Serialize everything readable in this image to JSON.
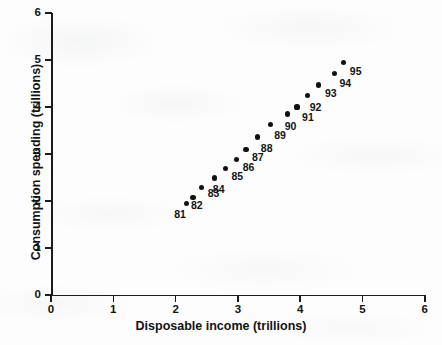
{
  "chart_data": {
    "type": "scatter",
    "title": "",
    "xlabel": "Disposable income (trillions)",
    "ylabel": "Consumption spending (trillions)",
    "xlim": [
      0,
      6
    ],
    "ylim": [
      0,
      6
    ],
    "xticks": [
      "0",
      "1",
      "2",
      "3",
      "4",
      "5",
      "6"
    ],
    "yticks": [
      "0",
      "1",
      "2",
      "3",
      "4",
      "5",
      "6"
    ],
    "grid": false,
    "legend": null,
    "marker_color": "#111111",
    "axis_color": "#1c1c1c",
    "background_color": "#fdfdfd",
    "point_label_position": "below-right",
    "points": [
      {
        "label": "81",
        "x": 2.17,
        "y": 1.95
      },
      {
        "label": "82",
        "x": 2.28,
        "y": 2.08
      },
      {
        "label": "83",
        "x": 2.42,
        "y": 2.28
      },
      {
        "label": "84",
        "x": 2.63,
        "y": 2.49
      },
      {
        "label": "85",
        "x": 2.8,
        "y": 2.7
      },
      {
        "label": "86",
        "x": 2.98,
        "y": 2.89
      },
      {
        "label": "87",
        "x": 3.13,
        "y": 3.09
      },
      {
        "label": "88",
        "x": 3.32,
        "y": 3.36
      },
      {
        "label": "89",
        "x": 3.52,
        "y": 3.62
      },
      {
        "label": "90",
        "x": 3.8,
        "y": 3.85
      },
      {
        "label": "91",
        "x": 3.95,
        "y": 4.0
      },
      {
        "label": "92",
        "x": 4.12,
        "y": 4.25
      },
      {
        "label": "93",
        "x": 4.3,
        "y": 4.47
      },
      {
        "label": "94",
        "x": 4.55,
        "y": 4.72
      },
      {
        "label": "95",
        "x": 4.7,
        "y": 4.95
      }
    ],
    "label_offsets": [
      {
        "label": "81",
        "dx": -12,
        "dy": 5
      },
      {
        "label": "82",
        "dx": -2,
        "dy": 2
      },
      {
        "label": "83",
        "dx": 6,
        "dy": -1
      },
      {
        "label": "84",
        "dx": -2,
        "dy": 5
      },
      {
        "label": "85",
        "dx": 6,
        "dy": 2
      },
      {
        "label": "86",
        "dx": 6,
        "dy": 2
      },
      {
        "label": "87",
        "dx": 6,
        "dy": 1
      },
      {
        "label": "88",
        "dx": 3,
        "dy": 5
      },
      {
        "label": "89",
        "dx": 4,
        "dy": 4
      },
      {
        "label": "90",
        "dx": -3,
        "dy": 6
      },
      {
        "label": "91",
        "dx": 5,
        "dy": 4
      },
      {
        "label": "92",
        "dx": 2,
        "dy": 6
      },
      {
        "label": "93",
        "dx": 6,
        "dy": 2
      },
      {
        "label": "94",
        "dx": 5,
        "dy": 4
      },
      {
        "label": "95",
        "dx": 6,
        "dy": 3
      }
    ]
  }
}
